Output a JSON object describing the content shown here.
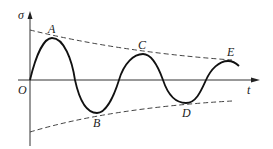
{
  "diagram": {
    "axes": {
      "y_label": "σ",
      "x_label": "t",
      "origin_label": "O"
    },
    "points": [
      {
        "label": "A",
        "x": 52,
        "y": 38
      },
      {
        "label": "B",
        "x": 97,
        "y": 113
      },
      {
        "label": "C",
        "x": 143,
        "y": 54
      },
      {
        "label": "D",
        "x": 186,
        "y": 103
      },
      {
        "label": "E",
        "x": 228,
        "y": 61
      }
    ],
    "colors": {
      "curve": "#111111",
      "axis": "#333333",
      "envelope": "#444444"
    }
  }
}
